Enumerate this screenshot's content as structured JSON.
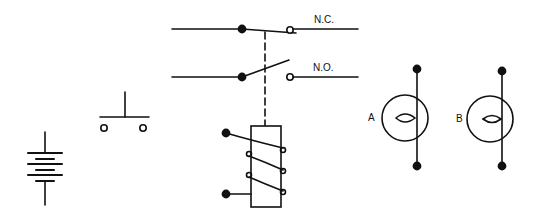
{
  "diagram": {
    "ink_color": "#111111",
    "background": "#ffffff",
    "symbols": [
      {
        "name": "battery",
        "label": ""
      },
      {
        "name": "push-button-switch",
        "label": ""
      },
      {
        "name": "relay-contacts",
        "contacts": [
          {
            "label": "N.C.",
            "type": "normally-closed"
          },
          {
            "label": "N.O.",
            "type": "normally-open"
          }
        ]
      },
      {
        "name": "relay-coil",
        "label": ""
      },
      {
        "name": "lamp",
        "label": "A"
      },
      {
        "name": "lamp",
        "label": "B"
      }
    ]
  },
  "labels": {
    "nc": "N.C.",
    "no": "N.O.",
    "lamp_a": "A",
    "lamp_b": "B"
  }
}
